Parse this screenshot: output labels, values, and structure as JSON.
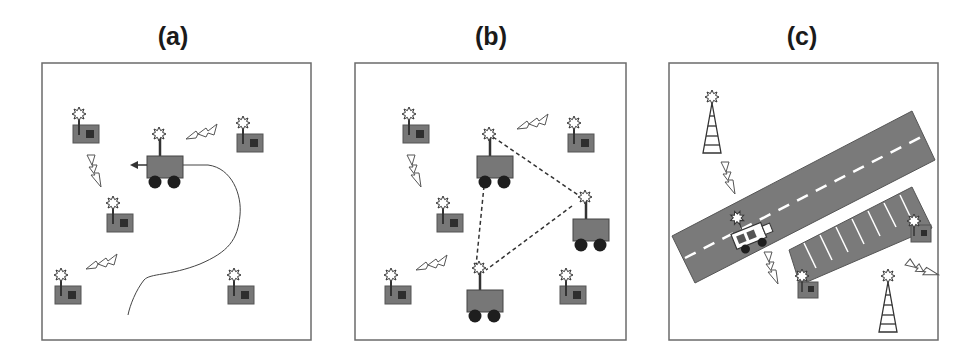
{
  "figure": {
    "panels": [
      {
        "id": "a",
        "label": "(a)",
        "description": "Mobile robot traversing field of static sensor nodes"
      },
      {
        "id": "b",
        "label": "(b)",
        "description": "Multiple mobile robots forming a network among sensor nodes"
      },
      {
        "id": "c",
        "label": "(c)",
        "description": "Vehicle on road communicating with roadside towers and parking-lot sensors"
      }
    ],
    "colors": {
      "frame": "#6b6b6b",
      "node_body": "#777777",
      "node_window": "#2e2e2e",
      "wheel": "#1e1e1e",
      "road": "#7a7a7a",
      "lane_mark": "#ffffff",
      "background": "#ffffff"
    },
    "icons": [
      "sensor-node-icon",
      "mobile-robot-icon",
      "lightning-signal-icon",
      "cell-tower-icon",
      "car-icon",
      "antenna-burst-icon"
    ]
  }
}
